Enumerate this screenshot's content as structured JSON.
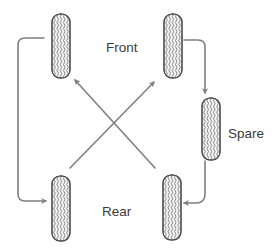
{
  "diagram": {
    "labels": {
      "front": "Front",
      "rear": "Rear",
      "spare": "Spare"
    },
    "tires": [
      {
        "id": "front-left",
        "position": "Front left"
      },
      {
        "id": "front-right",
        "position": "Front right"
      },
      {
        "id": "spare",
        "position": "Spare"
      },
      {
        "id": "rear-left",
        "position": "Rear left"
      },
      {
        "id": "rear-right",
        "position": "Rear right"
      }
    ],
    "moves": [
      {
        "from": "front-left",
        "to": "rear-left"
      },
      {
        "from": "front-right",
        "to": "spare"
      },
      {
        "from": "spare",
        "to": "rear-right"
      },
      {
        "from": "rear-left",
        "to": "front-right"
      },
      {
        "from": "rear-right",
        "to": "front-left"
      }
    ],
    "colors": {
      "arrow": "#7f7f7f",
      "tire_outline": "#4a4a4a",
      "tread": "#5a5a5a",
      "text": "#3a3a3a"
    }
  }
}
